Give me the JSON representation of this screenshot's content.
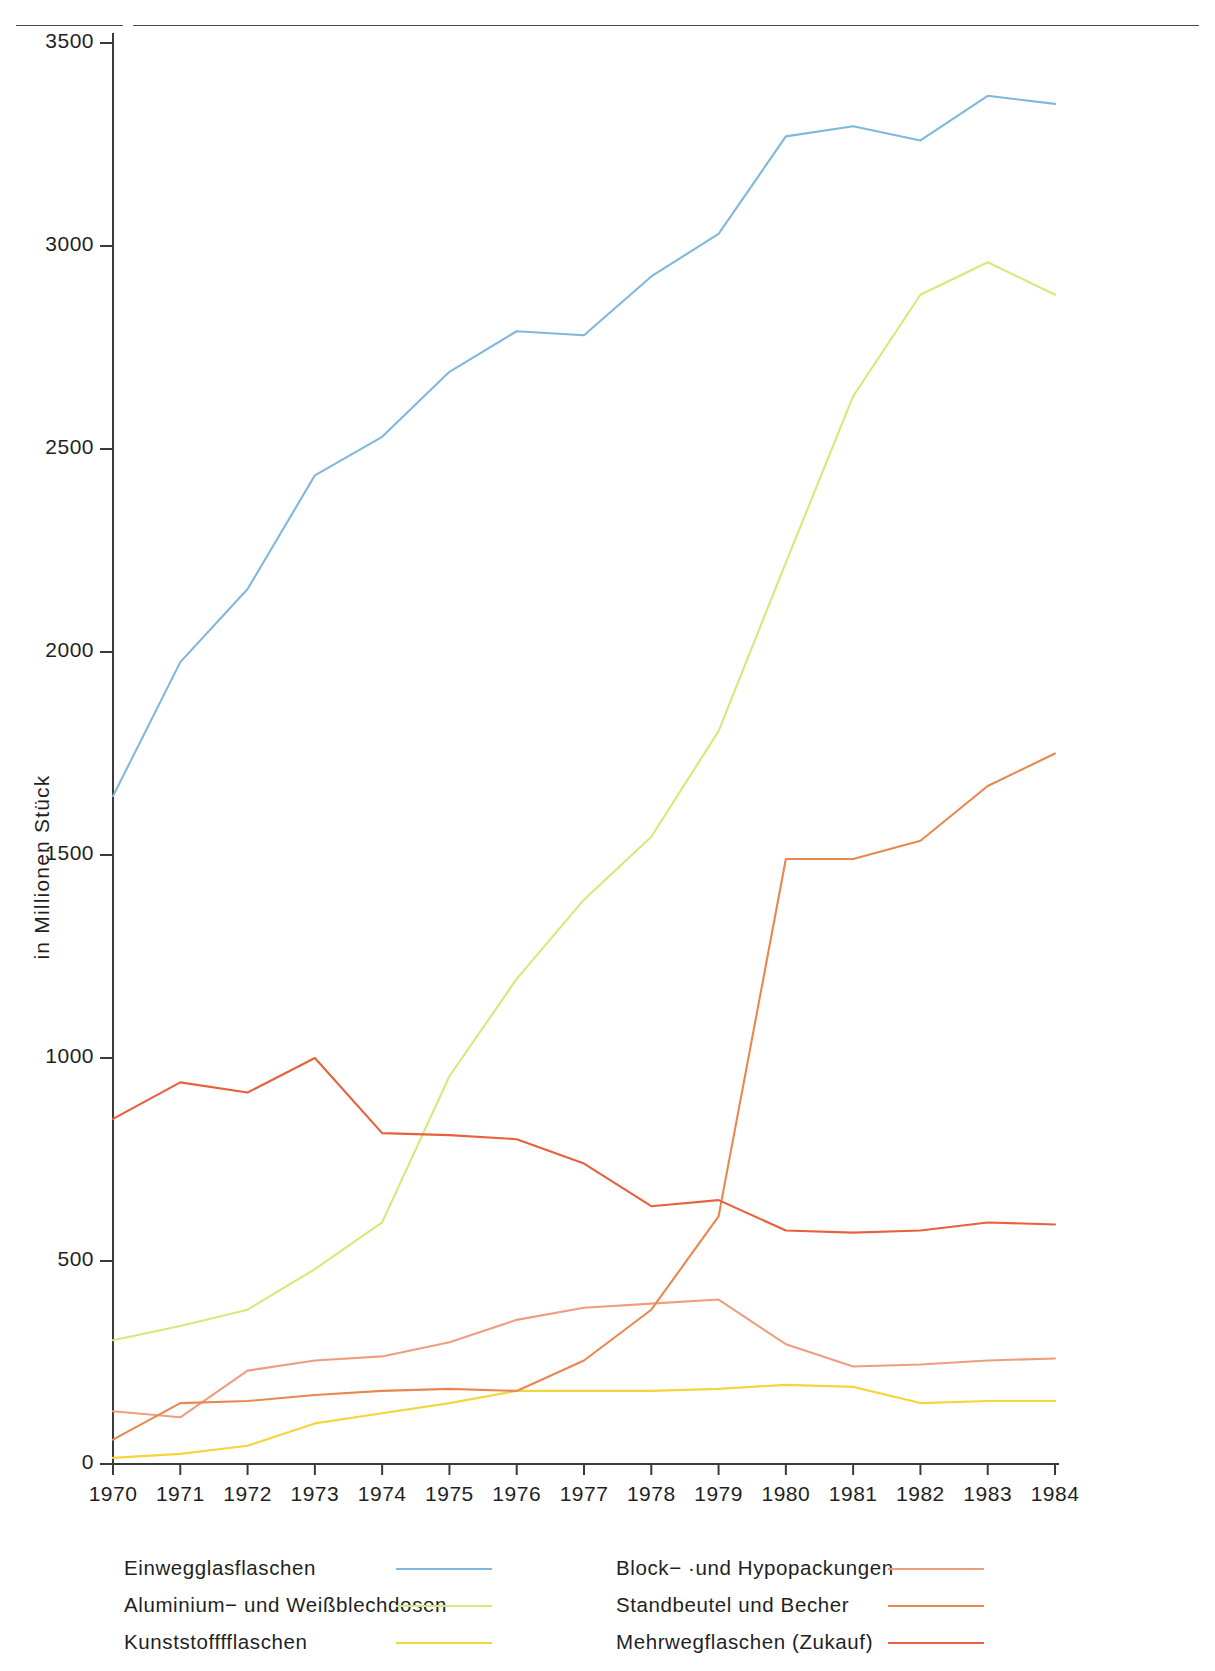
{
  "header": {
    "clipped_title": ""
  },
  "axes": {
    "y_axis_title": "in Millionen Stück",
    "y_ticks": [
      0,
      500,
      1000,
      1500,
      2000,
      2500,
      3000,
      3500
    ],
    "x_ticks": [
      1970,
      1971,
      1972,
      1973,
      1974,
      1975,
      1976,
      1977,
      1978,
      1979,
      1980,
      1981,
      1982,
      1983,
      1984
    ]
  },
  "legend": {
    "left_items": [
      {
        "label": "Einwegglasflaschen",
        "color": "#7fb8dc"
      },
      {
        "label": "Aluminium− und Weißblechdosen",
        "color": "#d7e87a"
      },
      {
        "label": "Kunststofffflaschen",
        "color": "#f2d63c"
      }
    ],
    "right_items": [
      {
        "label": "Block− ·und Hypopackungen",
        "color": "#ee9e7e"
      },
      {
        "label": "Standbeutel und Becher",
        "color": "#e8884e"
      },
      {
        "label": "Mehrwegflaschen (Zukauf)",
        "color": "#e8603c"
      }
    ]
  },
  "chart_data": {
    "type": "line",
    "title": "",
    "xlabel": "",
    "ylabel": "in Millionen Stück",
    "xlim": [
      1970,
      1984
    ],
    "ylim": [
      0,
      3500
    ],
    "grid": false,
    "legend_position": "bottom",
    "x": [
      1970,
      1971,
      1972,
      1973,
      1974,
      1975,
      1976,
      1977,
      1978,
      1979,
      1980,
      1981,
      1982,
      1983,
      1984
    ],
    "series": [
      {
        "name": "Einwegglasflaschen",
        "color": "#7fb8dc",
        "values": [
          1645,
          1975,
          2155,
          2435,
          2530,
          2690,
          2790,
          2780,
          2925,
          3030,
          3270,
          3295,
          3260,
          3370,
          3350
        ]
      },
      {
        "name": "Aluminium− und Weißblechdosen",
        "color": "#d7e87a",
        "values": [
          305,
          340,
          380,
          480,
          595,
          955,
          1195,
          1390,
          1545,
          1805,
          2220,
          2630,
          2880,
          2960,
          2880
        ]
      },
      {
        "name": "Kunststofffflaschen",
        "color": "#f2d63c",
        "values": [
          15,
          25,
          45,
          100,
          125,
          150,
          180,
          180,
          180,
          185,
          195,
          190,
          150,
          155,
          155
        ]
      },
      {
        "name": "Block− ·und Hypopackungen",
        "color": "#ee9e7e",
        "values": [
          130,
          115,
          230,
          255,
          265,
          300,
          355,
          385,
          395,
          405,
          295,
          240,
          245,
          255,
          260
        ]
      },
      {
        "name": "Standbeutel und Becher",
        "color": "#e8884e",
        "values": [
          60,
          150,
          155,
          170,
          180,
          185,
          180,
          255,
          380,
          610,
          1490,
          1490,
          1535,
          1670,
          1750
        ]
      },
      {
        "name": "Mehrwegflaschen (Zukauf)",
        "color": "#e8603c",
        "values": [
          850,
          940,
          915,
          1000,
          815,
          810,
          800,
          740,
          635,
          650,
          575,
          570,
          575,
          595,
          590
        ]
      }
    ]
  }
}
